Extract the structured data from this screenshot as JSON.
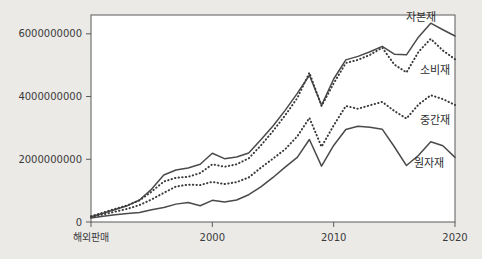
{
  "chart_data": {
    "type": "line",
    "title": "",
    "xlabel": "",
    "ylabel": "",
    "grid": false,
    "legend_position": "inline-right-end-of-line",
    "xlim": [
      1990,
      2020
    ],
    "ylim": [
      0,
      6600000000
    ],
    "x": [
      1990,
      1991,
      1992,
      1993,
      1994,
      1995,
      1996,
      1997,
      1998,
      1999,
      2000,
      2001,
      2002,
      2003,
      2004,
      2005,
      2006,
      2007,
      2008,
      2009,
      2010,
      2011,
      2012,
      2013,
      2014,
      2015,
      2016,
      2017,
      2018,
      2019,
      2020
    ],
    "x_tick_values": [
      1990,
      2000,
      2010,
      2020
    ],
    "x_tick_labels": [
      "해외판매",
      "2000",
      "2010",
      "2020"
    ],
    "y_tick_values": [
      0,
      2000000000,
      4000000000,
      6000000000
    ],
    "y_tick_labels": [
      "0",
      "2000000000",
      "4000000000",
      "6000000000"
    ],
    "series": [
      {
        "name": "자본재",
        "label": "자본재",
        "style": "solid",
        "color": "#4a4a4a",
        "values": [
          170000000,
          280000000,
          400000000,
          520000000,
          700000000,
          1050000000,
          1500000000,
          1660000000,
          1720000000,
          1840000000,
          2190000000,
          2020000000,
          2070000000,
          2200000000,
          2620000000,
          3060000000,
          3560000000,
          4100000000,
          4680000000,
          3720000000,
          4560000000,
          5170000000,
          5280000000,
          5430000000,
          5600000000,
          5350000000,
          5330000000,
          5900000000,
          6340000000,
          6130000000,
          5930000000
        ]
      },
      {
        "name": "소비재",
        "label": "소비재",
        "style": "dotted",
        "color": "#3c3c3c",
        "values": [
          185000000,
          300000000,
          420000000,
          530000000,
          690000000,
          970000000,
          1290000000,
          1410000000,
          1440000000,
          1560000000,
          1840000000,
          1760000000,
          1840000000,
          2030000000,
          2440000000,
          2900000000,
          3400000000,
          3950000000,
          4760000000,
          3700000000,
          4420000000,
          5070000000,
          5170000000,
          5330000000,
          5560000000,
          5020000000,
          4770000000,
          5430000000,
          5840000000,
          5470000000,
          5190000000
        ]
      },
      {
        "name": "중간재",
        "label": "중간재",
        "style": "dotted",
        "color": "#3c3c3c",
        "values": [
          150000000,
          240000000,
          330000000,
          420000000,
          540000000,
          720000000,
          930000000,
          1130000000,
          1190000000,
          1180000000,
          1280000000,
          1210000000,
          1270000000,
          1420000000,
          1730000000,
          2020000000,
          2320000000,
          2730000000,
          3320000000,
          2400000000,
          3080000000,
          3700000000,
          3610000000,
          3720000000,
          3830000000,
          3540000000,
          3300000000,
          3750000000,
          4040000000,
          3920000000,
          3730000000
        ]
      },
      {
        "name": "원자재",
        "label": "원자재",
        "style": "solid",
        "color": "#4a4a4a",
        "values": [
          130000000,
          180000000,
          230000000,
          270000000,
          300000000,
          390000000,
          460000000,
          570000000,
          620000000,
          520000000,
          690000000,
          640000000,
          700000000,
          870000000,
          1120000000,
          1420000000,
          1750000000,
          2060000000,
          2630000000,
          1780000000,
          2440000000,
          2950000000,
          3050000000,
          3020000000,
          2960000000,
          2400000000,
          1800000000,
          2130000000,
          2560000000,
          2430000000,
          2060000000
        ]
      }
    ],
    "series_label_positions": [
      {
        "name": "자본재",
        "x": 2016.0,
        "y": 6400000000
      },
      {
        "name": "소비재",
        "x": 2017.1,
        "y": 4710000000
      },
      {
        "name": "중간재",
        "x": 2017.1,
        "y": 3130000000
      },
      {
        "name": "원자재",
        "x": 2016.6,
        "y": 1760000000
      }
    ]
  },
  "figure": {
    "background_color": "#eceae7",
    "plot_background_color": "#ffffff",
    "axis_color": "#5a5a5a"
  }
}
